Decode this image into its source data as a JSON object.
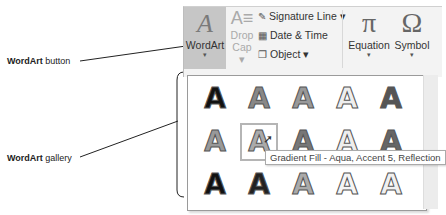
{
  "callouts": {
    "wordart_button": {
      "bold": "WordArt",
      "rest": " button"
    },
    "wordart_gallery": {
      "bold": "WordArt",
      "rest": " gallery"
    }
  },
  "ribbon": {
    "wordart": {
      "glyph": "A",
      "label": "WordArt",
      "caret": "▾"
    },
    "dropcap": {
      "glyph": "A≡",
      "label1": "Drop",
      "label2": "Cap ▾"
    },
    "signature_line": {
      "icon": "✎",
      "label": "Signature Line ▾"
    },
    "date_time": {
      "icon": "▦",
      "label": "Date & Time"
    },
    "object": {
      "icon": "❐",
      "label": "Object ▾"
    },
    "equation": {
      "glyph": "π",
      "label": "Equation",
      "caret": "▾"
    },
    "symbol": {
      "glyph": "Ω",
      "label": "Symbol",
      "caret": "▾"
    }
  },
  "gallery": {
    "rows": [
      [
        {
          "g": "A",
          "c": "#111"
        },
        {
          "g": "A",
          "c": "#888"
        },
        {
          "g": "A",
          "c": "#999"
        },
        {
          "g": "A",
          "c": "#eee"
        },
        {
          "g": "A",
          "c": "#555"
        }
      ],
      [
        {
          "g": "A",
          "c": "#999"
        },
        {
          "g": "A",
          "c": "#aaa"
        },
        {
          "g": "A",
          "c": "#777"
        },
        {
          "g": "A",
          "c": "#eee"
        },
        {
          "g": "A",
          "c": "#666"
        }
      ],
      [
        {
          "g": "A",
          "c": "#111"
        },
        {
          "g": "A",
          "c": "#222"
        },
        {
          "g": "A",
          "c": "#aaa"
        },
        {
          "g": "A",
          "c": "#f5f5f5"
        },
        {
          "g": "A",
          "c": "#f0f0f0"
        }
      ]
    ],
    "tooltip": "Gradient Fill - Aqua, Accent 5, Reflection",
    "cursor": "⇱"
  }
}
